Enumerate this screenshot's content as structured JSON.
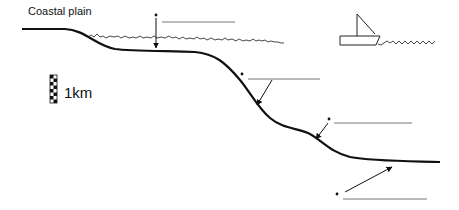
{
  "diagram": {
    "labels": {
      "coastal_plain": "Coastal plain",
      "scale": "1km"
    },
    "blank_labels": [
      {
        "id": "blank-1",
        "text": "",
        "target": "continental shelf"
      },
      {
        "id": "blank-2",
        "text": "",
        "target": "continental slope"
      },
      {
        "id": "blank-3",
        "text": "",
        "target": "continental rise"
      },
      {
        "id": "blank-4",
        "text": "",
        "target": "abyssal plain"
      }
    ],
    "icons": [
      "boat-icon",
      "scale-bar-icon",
      "arrow-icon"
    ],
    "colors": {
      "line": "#111111",
      "leader": "#555555",
      "water": "#333333",
      "background": "#ffffff"
    }
  }
}
